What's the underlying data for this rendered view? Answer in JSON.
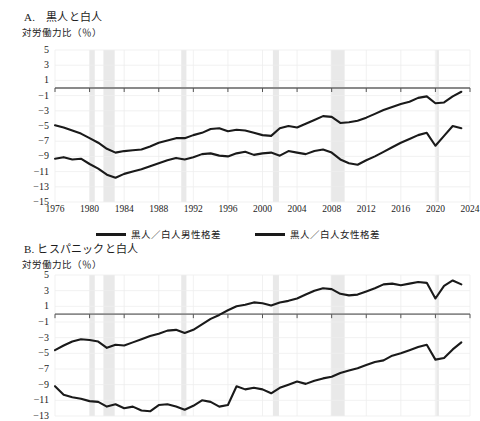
{
  "figure": {
    "background": "#ffffff",
    "line_color": "#1a1a1a",
    "recession_color": "#e9e9e9",
    "grid_color": "#eeeeee",
    "axis_color": "#8a8a8a"
  },
  "panels": {
    "a": {
      "title": "A.　黒人と白人",
      "axis_unit": "対労働力比（％）",
      "legend": [
        {
          "label": "黒人／白人男性格差",
          "color": "#1a1a1a"
        },
        {
          "label": "黒人／白人女性格差",
          "color": "#1a1a1a"
        }
      ]
    },
    "b": {
      "title": "B. ヒスパニックと白人",
      "axis_unit": "対労働力比（％）"
    }
  },
  "chart_data": [
    {
      "id": "panel-a",
      "type": "line",
      "title": "A.　黒人と白人",
      "xlabel": "",
      "ylabel": "対労働力比（％）",
      "xlim": [
        1976,
        2024
      ],
      "ylim": [
        -15,
        5
      ],
      "yticks": [
        5,
        3,
        1,
        -1,
        -3,
        -5,
        -7,
        -9,
        -11,
        -13,
        -15
      ],
      "ytick_labels": [
        "5",
        "3",
        "1",
        "−1",
        "−3",
        "−5",
        "−7",
        "−9",
        "−11",
        "−13",
        "−15"
      ],
      "xticks": [
        1976,
        1980,
        1984,
        1988,
        1992,
        1996,
        2000,
        2004,
        2008,
        2012,
        2016,
        2020,
        2024
      ],
      "xtick_labels": [
        "1976",
        "1980",
        "1984",
        "1988",
        "1992",
        "1996",
        "2000",
        "2004",
        "2008",
        "2012",
        "2016",
        "2020",
        "2024"
      ],
      "grid": true,
      "legend_position": "below",
      "zero_line": 0,
      "recession_bands": [
        [
          1980.0,
          1980.6
        ],
        [
          1981.6,
          1982.9
        ],
        [
          1990.6,
          1991.2
        ],
        [
          2001.2,
          2001.9
        ],
        [
          2007.9,
          2009.5
        ],
        [
          2020.1,
          2020.4
        ]
      ],
      "x": [
        1976,
        1977,
        1978,
        1979,
        1980,
        1981,
        1982,
        1983,
        1984,
        1985,
        1986,
        1987,
        1988,
        1989,
        1990,
        1991,
        1992,
        1993,
        1994,
        1995,
        1996,
        1997,
        1998,
        1999,
        2000,
        2001,
        2002,
        2003,
        2004,
        2005,
        2006,
        2007,
        2008,
        2009,
        2010,
        2011,
        2012,
        2013,
        2014,
        2015,
        2016,
        2017,
        2018,
        2019,
        2020,
        2021,
        2022,
        2023
      ],
      "series": [
        {
          "name": "黒人／白人男性格差",
          "values": [
            -4.9,
            -5.2,
            -5.6,
            -6.0,
            -6.6,
            -7.2,
            -8.0,
            -8.5,
            -8.3,
            -8.2,
            -8.1,
            -7.7,
            -7.2,
            -6.9,
            -6.6,
            -6.6,
            -6.2,
            -5.9,
            -5.4,
            -5.3,
            -5.7,
            -5.5,
            -5.6,
            -5.9,
            -6.2,
            -6.3,
            -5.3,
            -5.0,
            -5.2,
            -4.7,
            -4.2,
            -3.7,
            -3.8,
            -4.6,
            -4.5,
            -4.3,
            -3.9,
            -3.4,
            -2.9,
            -2.5,
            -2.1,
            -1.8,
            -1.3,
            -1.1,
            -2.0,
            -1.9,
            -1.1,
            -0.5
          ]
        },
        {
          "name": "黒人／白人女性格差",
          "values": [
            -9.3,
            -9.1,
            -9.4,
            -9.3,
            -10.0,
            -10.6,
            -11.4,
            -11.8,
            -11.3,
            -11.0,
            -10.7,
            -10.3,
            -9.9,
            -9.5,
            -9.2,
            -9.4,
            -9.1,
            -8.7,
            -8.6,
            -8.9,
            -9.0,
            -8.6,
            -8.4,
            -8.8,
            -8.6,
            -8.5,
            -8.9,
            -8.3,
            -8.5,
            -8.7,
            -8.3,
            -8.1,
            -8.5,
            -9.4,
            -9.9,
            -10.1,
            -9.5,
            -9.0,
            -8.4,
            -7.8,
            -7.2,
            -6.7,
            -6.2,
            -5.9,
            -7.6,
            -6.3,
            -5.0,
            -5.3
          ]
        }
      ]
    },
    {
      "id": "panel-b",
      "type": "line",
      "title": "B. ヒスパニックと白人",
      "xlabel": "",
      "ylabel": "対労働力比（％）",
      "xlim": [
        1976,
        2024
      ],
      "ylim": [
        -13,
        5
      ],
      "yticks": [
        5,
        3,
        1,
        -1,
        -3,
        -5,
        -7,
        -9,
        -11,
        -13
      ],
      "ytick_labels": [
        "5",
        "3",
        "1",
        "−1",
        "−3",
        "−5",
        "−7",
        "−9",
        "−11",
        "−13"
      ],
      "xticks": [
        1976,
        1980,
        1984,
        1988,
        1992,
        1996,
        2000,
        2004,
        2008,
        2012,
        2016,
        2020,
        2024
      ],
      "grid": true,
      "zero_line": 0,
      "truncated_bottom": true,
      "recession_bands": [
        [
          1980.0,
          1980.6
        ],
        [
          1981.6,
          1982.9
        ],
        [
          1990.6,
          1991.2
        ],
        [
          2001.2,
          2001.9
        ],
        [
          2007.9,
          2009.5
        ],
        [
          2020.1,
          2020.4
        ]
      ],
      "x": [
        1976,
        1977,
        1978,
        1979,
        1980,
        1981,
        1982,
        1983,
        1984,
        1985,
        1986,
        1987,
        1988,
        1989,
        1990,
        1991,
        1992,
        1993,
        1994,
        1995,
        1996,
        1997,
        1998,
        1999,
        2000,
        2001,
        2002,
        2003,
        2004,
        2005,
        2006,
        2007,
        2008,
        2009,
        2010,
        2011,
        2012,
        2013,
        2014,
        2015,
        2016,
        2017,
        2018,
        2019,
        2020,
        2021,
        2022,
        2023
      ],
      "series": [
        {
          "name": "ヒスパニック／白人男性格差",
          "values": [
            -4.6,
            -4.0,
            -3.5,
            -3.2,
            -3.3,
            -3.5,
            -4.3,
            -3.9,
            -4.0,
            -3.6,
            -3.2,
            -2.8,
            -2.5,
            -2.1,
            -2.0,
            -2.4,
            -2.0,
            -1.3,
            -0.6,
            -0.1,
            0.5,
            1.0,
            1.2,
            1.5,
            1.4,
            1.1,
            1.5,
            1.7,
            2.0,
            2.5,
            3.0,
            3.3,
            3.2,
            2.6,
            2.4,
            2.5,
            2.9,
            3.3,
            3.8,
            3.9,
            3.7,
            3.9,
            4.1,
            4.0,
            2.0,
            3.6,
            4.3,
            3.8
          ]
        },
        {
          "name": "ヒスパニック／白人女性格差",
          "values": [
            -9.2,
            -10.3,
            -10.6,
            -10.8,
            -11.1,
            -11.2,
            -11.8,
            -11.5,
            -12.0,
            -11.8,
            -12.3,
            -12.4,
            -11.6,
            -11.5,
            -11.8,
            -12.2,
            -11.7,
            -11.0,
            -11.2,
            -11.8,
            -11.6,
            -9.2,
            -9.6,
            -9.4,
            -9.6,
            -10.1,
            -9.4,
            -9.0,
            -8.6,
            -8.9,
            -8.5,
            -8.2,
            -8.0,
            -7.5,
            -7.2,
            -6.9,
            -6.5,
            -6.1,
            -5.9,
            -5.3,
            -5.0,
            -4.6,
            -4.2,
            -3.9,
            -5.8,
            -5.6,
            -4.5,
            -3.6
          ]
        }
      ]
    }
  ]
}
